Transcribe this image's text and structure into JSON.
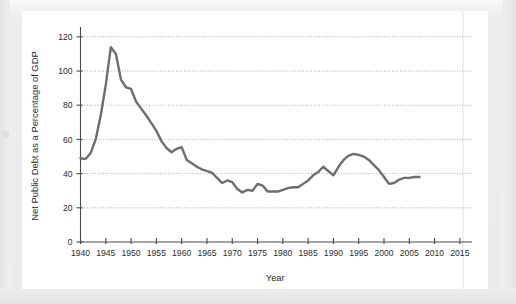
{
  "figure": {
    "panel_background": "#ffffff",
    "page_background": "#ebebeb"
  },
  "chart_data": {
    "type": "line",
    "title": "",
    "xlabel": "Year",
    "ylabel": "Net Public Debt as a Percentage of GDP",
    "xlim": [
      1940,
      2017
    ],
    "ylim": [
      0,
      124
    ],
    "xticks": [
      1940,
      1945,
      1950,
      1955,
      1960,
      1965,
      1970,
      1975,
      1980,
      1985,
      1990,
      1995,
      2000,
      2005,
      2010,
      2015
    ],
    "xtick_labels": [
      "1940",
      "1945",
      "1950",
      "1955",
      "1960",
      "1965",
      "1970",
      "1975",
      "1980",
      "1985",
      "1990",
      "1995",
      "2000",
      "2005",
      "2010",
      "2015"
    ],
    "yticks": [
      0,
      20,
      40,
      60,
      80,
      100,
      120
    ],
    "ytick_labels": [
      "0",
      "20",
      "40",
      "60",
      "80",
      "100",
      "120"
    ],
    "grid": "horizontal-dotted",
    "legend": "none",
    "line_color": "#6e6e6e",
    "series": [
      {
        "name": "Net Public Debt as a Percentage of GDP",
        "x": [
          1940,
          1941,
          1942,
          1943,
          1944,
          1945,
          1946,
          1947,
          1948,
          1949,
          1950,
          1951,
          1952,
          1953,
          1954,
          1955,
          1956,
          1957,
          1958,
          1959,
          1960,
          1961,
          1962,
          1963,
          1964,
          1965,
          1966,
          1967,
          1968,
          1969,
          1970,
          1971,
          1972,
          1973,
          1974,
          1975,
          1976,
          1977,
          1978,
          1979,
          1980,
          1981,
          1982,
          1983,
          1984,
          1985,
          1986,
          1987,
          1988,
          1989,
          1990,
          1991,
          1992,
          1993,
          1994,
          1995,
          1996,
          1997,
          1998,
          1999,
          2000,
          2001,
          2002,
          2003,
          2004,
          2005,
          2006,
          2007
        ],
        "y": [
          49.0,
          48.5,
          52.0,
          60.0,
          74.0,
          92.0,
          114.0,
          110.0,
          95.0,
          90.5,
          89.5,
          82.0,
          78.0,
          74.0,
          69.5,
          65.0,
          59.0,
          55.0,
          52.5,
          54.5,
          55.5,
          48.0,
          46.0,
          44.0,
          42.5,
          41.5,
          40.5,
          37.5,
          34.5,
          36.0,
          35.0,
          31.0,
          29.0,
          30.5,
          30.0,
          34.0,
          33.0,
          29.5,
          29.5,
          29.5,
          30.5,
          31.5,
          32.0,
          32.0,
          34.0,
          36.0,
          39.0,
          41.0,
          44.0,
          41.5,
          39.0,
          44.0,
          48.0,
          50.5,
          51.5,
          51.0,
          50.0,
          48.0,
          45.0,
          42.0,
          38.0,
          34.0,
          34.5,
          36.5,
          37.5,
          37.5,
          38.0,
          38.0
        ]
      }
    ]
  }
}
